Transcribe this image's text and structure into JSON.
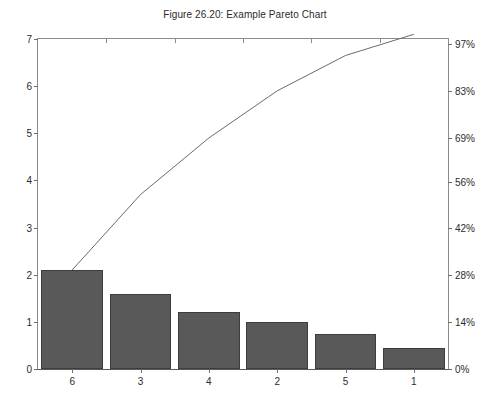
{
  "chart_data": {
    "type": "bar",
    "title": "Figure 26.20: Example Pareto Chart",
    "xlabel": "",
    "ylabel": "",
    "categories": [
      "6",
      "3",
      "4",
      "2",
      "5",
      "1"
    ],
    "values": [
      2.1,
      1.6,
      1.2,
      1.0,
      0.75,
      0.45
    ],
    "ylim": [
      0,
      7
    ],
    "yticks": [
      0,
      1,
      2,
      3,
      4,
      5,
      6,
      7
    ],
    "ytick_labels": [
      "0",
      "1",
      "2",
      "3",
      "4",
      "5",
      "6",
      "7"
    ],
    "grid": false,
    "legend": "none",
    "series": [
      {
        "name": "Count",
        "type": "bar",
        "values": [
          2.1,
          1.6,
          1.2,
          1.0,
          0.75,
          0.45
        ]
      },
      {
        "name": "Cumulative",
        "type": "line",
        "values": [
          2.1,
          3.7,
          4.9,
          5.9,
          6.65,
          7.1
        ],
        "percent_values": [
          29.6,
          52.1,
          69.0,
          83.1,
          93.7,
          100.0
        ]
      }
    ],
    "secondary_axis": {
      "position": "right",
      "label": "",
      "ylim": [
        0,
        100
      ],
      "ticks": [
        0,
        14,
        28,
        42,
        56,
        69,
        83,
        97
      ],
      "tick_labels": [
        "0%",
        "14%",
        "28%",
        "42%",
        "56%",
        "69%",
        "83%",
        "97%"
      ],
      "total": 7.1
    },
    "colors": {
      "bar_fill": "#595959",
      "bar_edge": "#3d3d3d",
      "line": "#6b6b6b",
      "axis": "#8c8c8c",
      "text": "#2b2b2b",
      "background": "#ffffff"
    }
  }
}
